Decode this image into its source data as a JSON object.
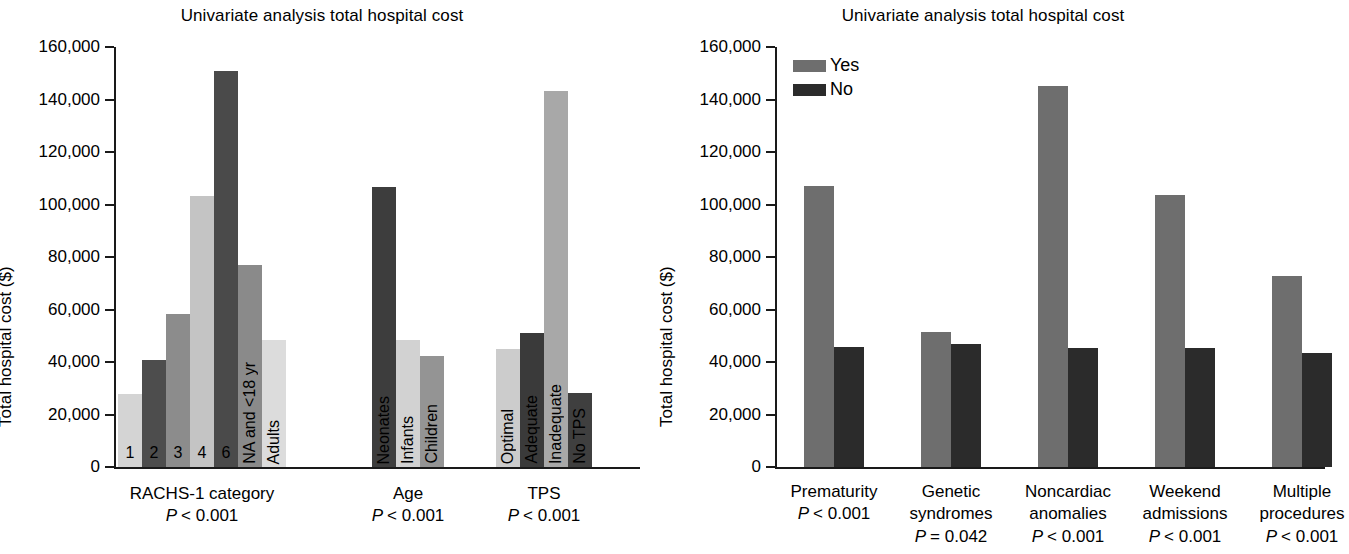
{
  "figure": {
    "panels": [
      {
        "id": "left",
        "title": "Univariate analysis total hospital cost",
        "ylabel": "Total hospital cost ($)"
      },
      {
        "id": "right",
        "title": "Univariate analysis total hospital cost",
        "ylabel": "Total hospital cost ($)"
      }
    ]
  },
  "legend": {
    "title": "",
    "items": [
      {
        "label": "Yes",
        "color": "#6e6e6e"
      },
      {
        "label": "No",
        "color": "#2b2b2b"
      }
    ]
  },
  "chart_data": [
    {
      "type": "bar",
      "id": "left-panel",
      "title": "Univariate analysis total hospital cost",
      "xlabel": "",
      "ylabel": "Total hospital cost ($)",
      "ylim": [
        0,
        160000
      ],
      "ytick_labels": [
        "0",
        "20,000",
        "40,000",
        "60,000",
        "80,000",
        "100,000",
        "120,000",
        "140,000",
        "160,000"
      ],
      "ytick_values": [
        0,
        20000,
        40000,
        60000,
        80000,
        100000,
        120000,
        140000,
        160000
      ],
      "grid": false,
      "legend_position": "none",
      "groups": [
        {
          "name": "RACHS-1 category",
          "pvalue": "P < 0.001",
          "pvalue_op": "<",
          "pvalue_num": "0.001",
          "categories": [
            "1",
            "2",
            "3",
            "4",
            "6",
            "NA and <18 yr",
            "Adults"
          ],
          "values": [
            27800,
            40900,
            58400,
            103400,
            150700,
            76800,
            48300
          ],
          "colors": [
            "#d4d4d4",
            "#4d4d4d",
            "#8c8c8c",
            "#c4c4c4",
            "#4a4a4a",
            "#8a8a8a",
            "#dcdcdc"
          ],
          "label_orientation": [
            "upright",
            "upright",
            "upright",
            "upright",
            "upright",
            "vertical",
            "vertical"
          ]
        },
        {
          "name": "Age",
          "pvalue": "P < 0.001",
          "pvalue_op": "<",
          "pvalue_num": "0.001",
          "categories": [
            "Neonates",
            "Infants",
            "Children"
          ],
          "values": [
            106800,
            48200,
            42200
          ],
          "colors": [
            "#3d3d3d",
            "#d2d2d2",
            "#949494"
          ],
          "label_orientation": [
            "vertical",
            "vertical",
            "vertical"
          ]
        },
        {
          "name": "TPS",
          "pvalue": "P < 0.001",
          "pvalue_op": "<",
          "pvalue_num": "0.001",
          "categories": [
            "Optimal",
            "Adequate",
            "Inadequate",
            "No TPS"
          ],
          "values": [
            44900,
            51100,
            143200,
            28100
          ],
          "colors": [
            "#cccccc",
            "#3a3a3a",
            "#a8a8a8",
            "#3f3f3f"
          ],
          "label_orientation": [
            "vertical",
            "vertical",
            "vertical",
            "vertical"
          ]
        }
      ]
    },
    {
      "type": "bar",
      "id": "right-panel",
      "title": "Univariate analysis total hospital cost",
      "xlabel": "",
      "ylabel": "Total hospital cost ($)",
      "ylim": [
        0,
        160000
      ],
      "ytick_labels": [
        "0",
        "20,000",
        "40,000",
        "60,000",
        "80,000",
        "100,000",
        "120,000",
        "140,000",
        "160,000"
      ],
      "ytick_values": [
        0,
        20000,
        40000,
        60000,
        80000,
        100000,
        120000,
        140000,
        160000
      ],
      "grid": false,
      "legend_position": "upper-left",
      "categories": [
        {
          "line1": "Prematurity",
          "line2": "",
          "pvalue_op": "<",
          "pvalue_num": "0.001"
        },
        {
          "line1": "Genetic",
          "line2": "syndromes",
          "pvalue_op": "=",
          "pvalue_num": "0.042"
        },
        {
          "line1": "Noncardiac",
          "line2": "anomalies",
          "pvalue_op": "<",
          "pvalue_num": "0.001"
        },
        {
          "line1": "Weekend",
          "line2": "admissions",
          "pvalue_op": "<",
          "pvalue_num": "0.001"
        },
        {
          "line1": "Multiple",
          "line2": "procedures",
          "pvalue_op": "<",
          "pvalue_num": "0.001"
        }
      ],
      "series": [
        {
          "name": "Yes",
          "color": "#6e6e6e",
          "values": [
            107000,
            51600,
            145300,
            103800,
            72800
          ]
        },
        {
          "name": "No",
          "color": "#2b2b2b",
          "values": [
            45800,
            47000,
            45400,
            45200,
            43600
          ]
        }
      ]
    }
  ]
}
